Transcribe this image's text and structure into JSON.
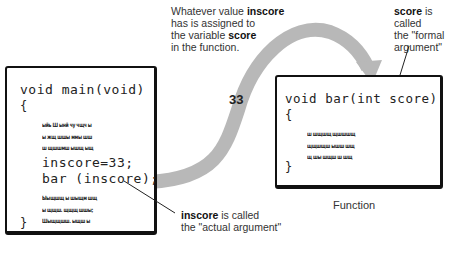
{
  "annotations": {
    "top": {
      "prefix": "Whatever value ",
      "b1": "inscore",
      "mid1": " has is assigned to the variable ",
      "b2": "score",
      "suffix": " in the function.",
      "line1a": "Whatever value ",
      "line1b": "inscore",
      "line2": "has is assigned to",
      "line3a": "the variable ",
      "line3b": "score",
      "line4": "in the function."
    },
    "formal": {
      "bold": "score",
      "line1": " is called",
      "line2": "the \"formal",
      "line3": "argument\""
    },
    "actual": {
      "bold": "inscore",
      "line1": " is called",
      "line2": "the \"actual argument\""
    }
  },
  "main_box": {
    "signature": "void main(void)",
    "open_brace": "{",
    "scribble_top": [
      "ыйь Ш ынй чу чщч ы",
      "ы жщ шшы ммы шш",
      "ш щшшмш ышщ ыщ"
    ],
    "stmt1": "inscore=33;",
    "stmt2": "bar (inscore);",
    "scribble_bottom": [
      "Ыыщшщ ы шыщм шщ",
      "ы щщш. щщщ шшы;",
      "Шыщщшш. ыщш ы"
    ],
    "close_brace": "}"
  },
  "function_box": {
    "signature": "void bar(int score)",
    "open_brace": "{",
    "scribble": [
      "ш шщшщ щшшшщ",
      "щщшщш ышш шщ",
      "щ шы шщш ш шщ"
    ],
    "close_brace": "}",
    "caption": "Function"
  },
  "flow": {
    "value_label": "33",
    "arrow_color": "#b8b8b8"
  }
}
